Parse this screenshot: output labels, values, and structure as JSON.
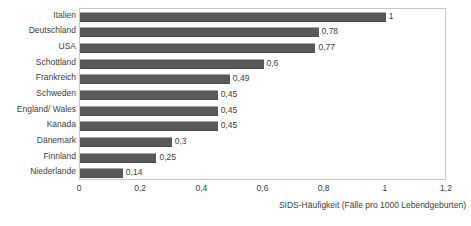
{
  "chart_data": {
    "type": "bar",
    "orientation": "horizontal",
    "title": "",
    "xlabel": "SIDS-Häufigkeit (Fälle pro 1000 Lebendgeburten)",
    "ylabel": "",
    "xlim": [
      0,
      1.2
    ],
    "xticks": [
      0,
      0.2,
      0.4,
      0.6,
      0.8,
      1,
      1.2
    ],
    "xtick_labels": [
      "0",
      "0,2",
      "0,4",
      "0,6",
      "0,8",
      "1",
      "1,2"
    ],
    "grid": false,
    "legend": null,
    "decimal_separator": ",",
    "bar_color": "#595959",
    "categories": [
      "Italien",
      "Deutschland",
      "USA",
      "Schottland",
      "Frankreich",
      "Schweden",
      "England/ Wales",
      "Kanada",
      "Dänemark",
      "Finnland",
      "Niederlande"
    ],
    "values": [
      1,
      0.78,
      0.77,
      0.6,
      0.49,
      0.45,
      0.45,
      0.45,
      0.3,
      0.25,
      0.14
    ],
    "value_labels": [
      "1",
      "0,78",
      "0,77",
      "0,6",
      "0,49",
      "0,45",
      "0,45",
      "0,45",
      "0,3",
      "0,25",
      "0,14"
    ]
  }
}
